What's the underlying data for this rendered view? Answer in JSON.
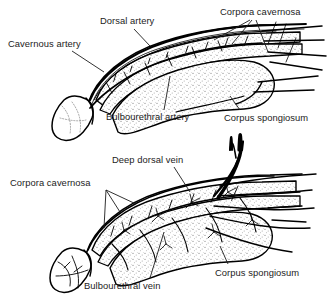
{
  "figure": {
    "panels": [
      {
        "id": "upper",
        "caption": "Arterial supply",
        "labels": [
          {
            "name": "dorsal-artery",
            "text": "Dorsal artery"
          },
          {
            "name": "cavernous-artery",
            "text": "Cavernous artery"
          },
          {
            "name": "corpora-cavernosa",
            "text": "Corpora cavernosa"
          },
          {
            "name": "bulbourethral-artery",
            "text": "Bulbourethral artery"
          },
          {
            "name": "corpus-spongiosum",
            "text": "Corpus spongiosum"
          }
        ]
      },
      {
        "id": "lower",
        "caption": "Venous drainage",
        "labels": [
          {
            "name": "deep-dorsal-vein",
            "text": "Deep dorsal vein"
          },
          {
            "name": "corpora-cavernosa",
            "text": "Corpora cavernosa"
          },
          {
            "name": "bulbourethral-vein",
            "text": "Bulbourethral vein"
          },
          {
            "name": "corpus-spongiosum",
            "text": "Corpus spongiosum"
          }
        ]
      }
    ],
    "colors": {
      "ink": "#1c1c1c",
      "line": "#000000",
      "background": "#ffffff",
      "stipple": "#8a8a8a"
    }
  }
}
